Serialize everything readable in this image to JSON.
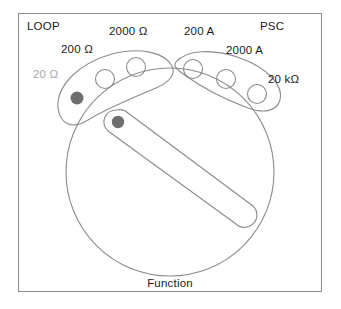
{
  "figure": {
    "type": "device-illustration",
    "frame": {
      "border_color": "#8c8c8c",
      "background": "#ffffff"
    },
    "ink_color": "#8c8c8c",
    "dimmed_color": "#a8a8a8",
    "marker_fill": "#6e6e6e",
    "text_color": "#1a1a1a"
  },
  "corner_labels": {
    "top_left": "LOOP",
    "top_right": "PSC"
  },
  "caption": "Function",
  "left_arc": {
    "name": "resistance-range-arc",
    "positions": [
      {
        "label": "20 Ω",
        "state": "selected",
        "dimmed": true
      },
      {
        "label": "200 Ω",
        "state": "open",
        "dimmed": false
      },
      {
        "label": "2000 Ω",
        "state": "open",
        "dimmed": false
      }
    ]
  },
  "right_arc": {
    "name": "current-range-arc",
    "positions": [
      {
        "label": "200 A",
        "state": "open",
        "dimmed": false
      },
      {
        "label": "2000 A",
        "state": "open",
        "dimmed": false
      },
      {
        "label": "20 kΩ",
        "state": "open",
        "dimmed": false
      }
    ]
  },
  "pointer": {
    "name": "dial-pointer",
    "marker": "selection-dot",
    "orientation": "upper-left to lower-right"
  }
}
